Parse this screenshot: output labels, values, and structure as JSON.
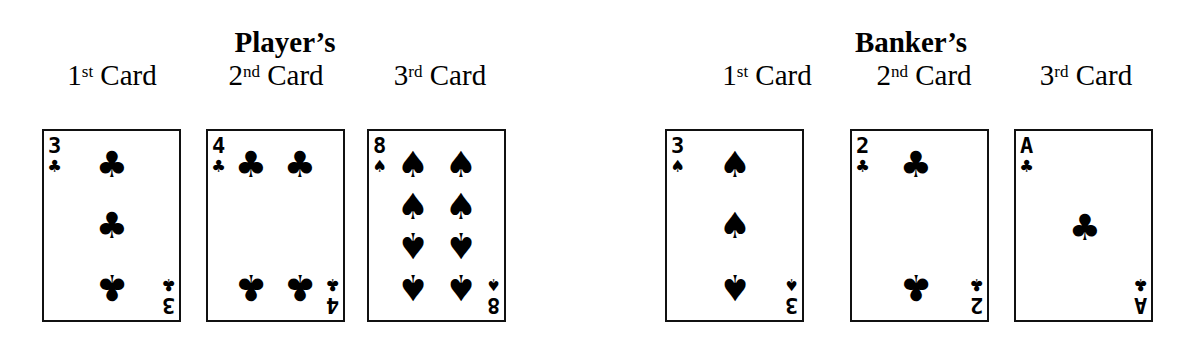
{
  "player": {
    "title": "Player’s",
    "columns": [
      {
        "num": "1",
        "suffix": "st",
        "word": " Card"
      },
      {
        "num": "2",
        "suffix": "nd",
        "word": " Card"
      },
      {
        "num": "3",
        "suffix": "rd",
        "word": " Card"
      }
    ],
    "cards": [
      {
        "rank": "3",
        "suit": "clubs",
        "suit_glyph": "♣"
      },
      {
        "rank": "4",
        "suit": "clubs",
        "suit_glyph": "♣"
      },
      {
        "rank": "8",
        "suit": "spades",
        "suit_glyph": "♠"
      }
    ]
  },
  "banker": {
    "title": "Banker’s",
    "columns": [
      {
        "num": "1",
        "suffix": "st",
        "word": " Card"
      },
      {
        "num": "2",
        "suffix": "nd",
        "word": " Card"
      },
      {
        "num": "3",
        "suffix": "rd",
        "word": " Card"
      }
    ],
    "cards": [
      {
        "rank": "3",
        "suit": "spades",
        "suit_glyph": "♠"
      },
      {
        "rank": "2",
        "suit": "clubs",
        "suit_glyph": "♣"
      },
      {
        "rank": "A",
        "suit": "clubs",
        "suit_glyph": "♣"
      }
    ]
  },
  "colors": {
    "ink": "#000000",
    "background": "#ffffff",
    "card_border": "#111111"
  }
}
